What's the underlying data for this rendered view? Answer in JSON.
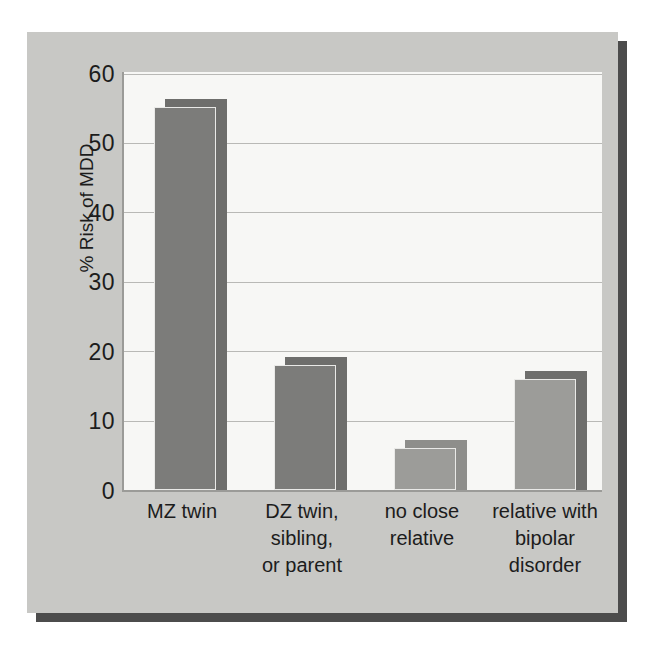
{
  "chart_data": {
    "type": "bar",
    "title": "",
    "subtitle": "",
    "xlabel": "",
    "ylabel": "% Risk of MDD",
    "categories": [
      "MZ twin",
      "DZ twin, sibling, or parent",
      "no close relative",
      "relative with bipolar disorder"
    ],
    "category_lines": [
      [
        "MZ twin"
      ],
      [
        "DZ twin,",
        "sibling,",
        "or parent"
      ],
      [
        "no close",
        "relative"
      ],
      [
        "relative with",
        "bipolar",
        "disorder"
      ]
    ],
    "values": [
      55,
      18,
      6,
      16
    ],
    "ylim": [
      0,
      60
    ],
    "ytick_labels": [
      "60",
      "50",
      "40",
      "30",
      "20",
      "10",
      "0"
    ],
    "ytick_values": [
      60,
      50,
      40,
      30,
      20,
      10,
      0
    ],
    "grid": true,
    "legend": "none",
    "style": "3d-bars",
    "colors": {
      "panel_background": "#c8c8c5",
      "panel_shadow": "#4c4c4c",
      "plot_background": "#f7f7f5",
      "gridline": "#b9b9b6",
      "axis_line": "#9b9b98",
      "bar_front_dark": "#7c7c7a",
      "bar_back_dark": "#6e6e6c",
      "bar_front_light": "#9c9c99",
      "bar_back_light": "#8e8e8b",
      "text": "#1c1c1c"
    }
  }
}
